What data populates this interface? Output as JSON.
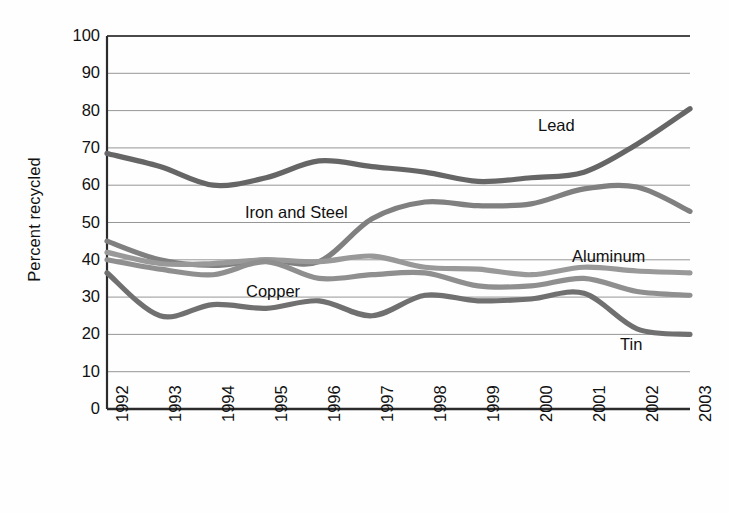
{
  "chart_data": {
    "type": "line",
    "title": "",
    "subtitle": "",
    "xlabel": "",
    "ylabel": "Percent recycled",
    "ylim": [
      0,
      100
    ],
    "ytick_step": 10,
    "yticks": [
      100,
      90,
      80,
      70,
      60,
      50,
      40,
      30,
      20,
      10,
      0
    ],
    "categories": [
      "1992",
      "1993",
      "1994",
      "1995",
      "1996",
      "1997",
      "1998",
      "1999",
      "2000",
      "2001",
      "2002",
      "2003"
    ],
    "x": [
      1992,
      1993,
      1994,
      1995,
      1996,
      1997,
      1998,
      1999,
      2000,
      2001,
      2002,
      2003
    ],
    "grid": "horizontal",
    "legend": "inline-annotations",
    "legend_position": "inline",
    "series": [
      {
        "name": "Lead",
        "color": "#666666",
        "values": [
          68.5,
          65.0,
          60.0,
          62.0,
          66.5,
          65.0,
          63.5,
          61.0,
          62.0,
          63.5,
          71.0,
          80.5
        ]
      },
      {
        "name": "Iron and Steel",
        "color": "#808080",
        "values": [
          45.0,
          40.0,
          38.5,
          40.0,
          39.5,
          51.0,
          55.5,
          54.5,
          55.0,
          59.0,
          59.5,
          53.0
        ]
      },
      {
        "name": "Copper",
        "color": "#999999",
        "values": [
          42.0,
          39.0,
          39.0,
          40.0,
          39.5,
          41.0,
          38.0,
          37.5,
          36.0,
          38.0,
          37.0,
          36.5
        ]
      },
      {
        "name": "Aluminum",
        "color": "#8f8f8f",
        "values": [
          40.0,
          37.5,
          36.0,
          39.5,
          35.0,
          36.0,
          36.5,
          33.0,
          33.0,
          35.0,
          31.5,
          30.5
        ]
      },
      {
        "name": "Tin",
        "color": "#707070",
        "values": [
          36.5,
          25.0,
          28.0,
          27.0,
          29.0,
          25.0,
          30.5,
          29.0,
          29.5,
          31.0,
          21.5,
          20.0
        ]
      }
    ],
    "annotations": [
      {
        "text": "Lead",
        "x_px": 538,
        "y_px": 117
      },
      {
        "text": "Iron and Steel",
        "x_px": 245,
        "y_px": 204
      },
      {
        "text": "Copper",
        "x_px": 246,
        "y_px": 283
      },
      {
        "text": "Aluminum",
        "x_px": 572,
        "y_px": 248
      },
      {
        "text": "Tin",
        "x_px": 620,
        "y_px": 336
      }
    ]
  },
  "axis": {
    "y_title": "Percent recycled",
    "y_tick_labels": [
      "100",
      "90",
      "80",
      "70",
      "60",
      "50",
      "40",
      "30",
      "20",
      "10",
      "0"
    ],
    "x_tick_labels": [
      "1992",
      "1993",
      "1994",
      "1995",
      "1996",
      "1997",
      "1998",
      "1999",
      "2000",
      "2001",
      "2002",
      "2003"
    ]
  },
  "colors": {
    "grid": "#8a8a8a",
    "frame": "#2b2b2b",
    "plot_background": "#fbfbfb",
    "text": "#111111"
  }
}
